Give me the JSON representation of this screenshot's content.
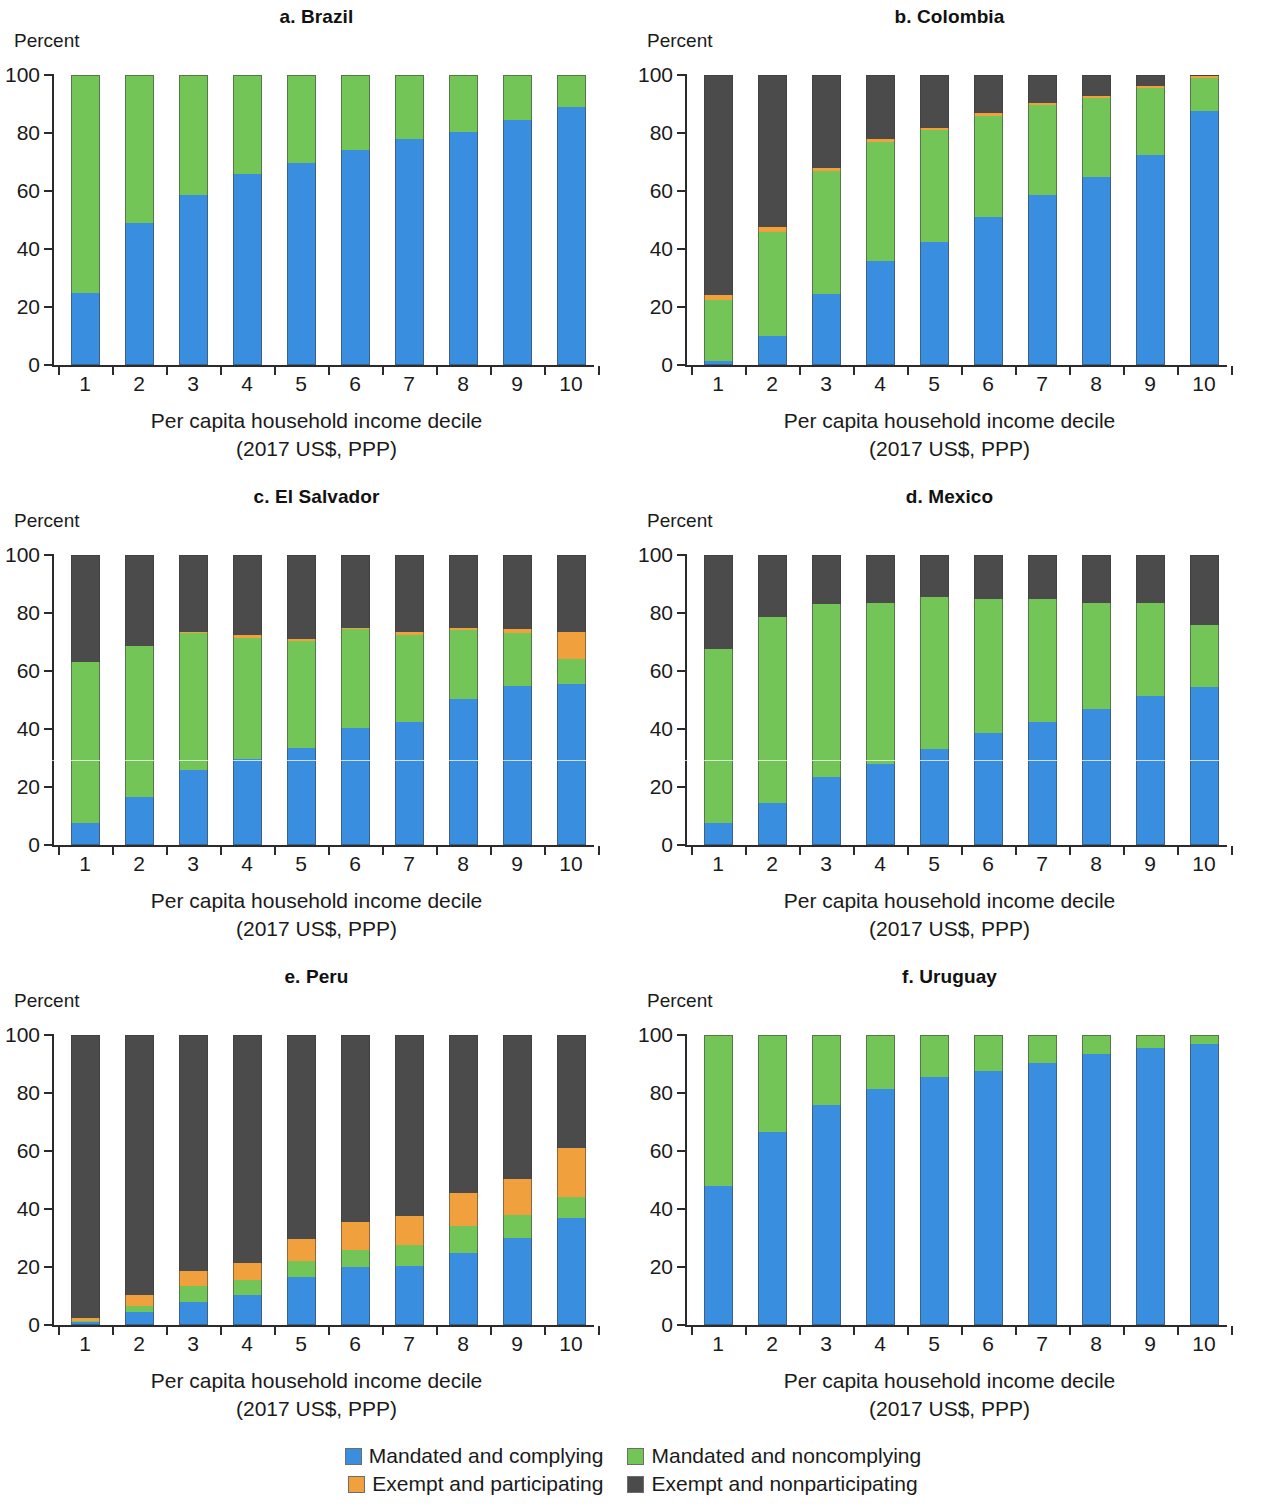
{
  "figure": {
    "y_axis_label": "Percent",
    "x_axis_title_line1": "Per capita household income decile",
    "x_axis_title_line2": "(2017 US$, PPP)",
    "y_ticks": [
      "0",
      "20",
      "40",
      "60",
      "80",
      "100"
    ],
    "x_categories": [
      "1",
      "2",
      "3",
      "4",
      "5",
      "6",
      "7",
      "8",
      "9",
      "10"
    ]
  },
  "legend": {
    "items": [
      {
        "label": "Mandated and complying",
        "color": "#3a8ee0",
        "key": "mandated_complying"
      },
      {
        "label": "Mandated and noncomplying",
        "color": "#73c557",
        "key": "mandated_noncomplying"
      },
      {
        "label": "Exempt and participating",
        "color": "#f1a03e",
        "key": "exempt_participating"
      },
      {
        "label": "Exempt and nonparticipating",
        "color": "#4b4b4b",
        "key": "exempt_nonparticipating"
      }
    ]
  },
  "chart_data": [
    {
      "type": "bar",
      "stacked": true,
      "title": "a. Brazil",
      "panel_letter": "a",
      "country": "Brazil",
      "xlabel": "Per capita household income decile (2017 US$, PPP)",
      "ylabel": "Percent",
      "ylim": [
        0,
        100
      ],
      "grid": false,
      "legend_position": "bottom-figure",
      "categories": [
        "1",
        "2",
        "3",
        "4",
        "5",
        "6",
        "7",
        "8",
        "9",
        "10"
      ],
      "series": [
        {
          "name": "Mandated and complying",
          "color": "#3a8ee0",
          "values": [
            25.0,
            49.0,
            58.5,
            66.0,
            69.5,
            74.0,
            78.0,
            80.5,
            84.5,
            89.0
          ]
        },
        {
          "name": "Mandated and noncomplying",
          "color": "#73c557",
          "values": [
            75.0,
            51.0,
            41.5,
            34.0,
            30.5,
            26.0,
            22.0,
            19.5,
            15.5,
            11.0
          ]
        },
        {
          "name": "Exempt and participating",
          "color": "#f1a03e",
          "values": [
            0,
            0,
            0,
            0,
            0,
            0,
            0,
            0,
            0,
            0
          ]
        },
        {
          "name": "Exempt and nonparticipating",
          "color": "#4b4b4b",
          "values": [
            0,
            0,
            0,
            0,
            0,
            0,
            0,
            0,
            0,
            0
          ]
        }
      ]
    },
    {
      "type": "bar",
      "stacked": true,
      "title": "b. Colombia",
      "panel_letter": "b",
      "country": "Colombia",
      "xlabel": "Per capita household income decile (2017 US$, PPP)",
      "ylabel": "Percent",
      "ylim": [
        0,
        100
      ],
      "grid": false,
      "legend_position": "bottom-figure",
      "categories": [
        "1",
        "2",
        "3",
        "4",
        "5",
        "6",
        "7",
        "8",
        "9",
        "10"
      ],
      "series": [
        {
          "name": "Mandated and complying",
          "color": "#3a8ee0",
          "values": [
            1.5,
            10.0,
            24.5,
            36.0,
            42.5,
            51.0,
            58.5,
            65.0,
            72.5,
            87.5
          ]
        },
        {
          "name": "Mandated and noncomplying",
          "color": "#73c557",
          "values": [
            21.0,
            36.0,
            42.5,
            41.0,
            38.5,
            35.0,
            31.0,
            27.0,
            23.0,
            11.5
          ]
        },
        {
          "name": "Exempt and participating",
          "color": "#f1a03e",
          "values": [
            1.5,
            1.5,
            1.0,
            0.8,
            0.8,
            0.8,
            0.8,
            0.8,
            0.8,
            0.5
          ]
        },
        {
          "name": "Exempt and nonparticipating",
          "color": "#4b4b4b",
          "values": [
            76.0,
            52.5,
            32.0,
            22.2,
            18.2,
            13.2,
            9.7,
            7.2,
            3.7,
            0.5
          ]
        }
      ]
    },
    {
      "type": "bar",
      "stacked": true,
      "title": "c. El Salvador",
      "panel_letter": "c",
      "country": "El Salvador",
      "xlabel": "Per capita household income decile (2017 US$, PPP)",
      "ylabel": "Percent",
      "ylim": [
        0,
        100
      ],
      "grid": false,
      "legend_position": "bottom-figure",
      "categories": [
        "1",
        "2",
        "3",
        "4",
        "5",
        "6",
        "7",
        "8",
        "9",
        "10"
      ],
      "series": [
        {
          "name": "Mandated and complying",
          "color": "#3a8ee0",
          "values": [
            7.5,
            16.5,
            26.0,
            29.5,
            33.5,
            40.5,
            42.5,
            50.5,
            55.0,
            55.5
          ]
        },
        {
          "name": "Mandated and noncomplying",
          "color": "#73c557",
          "values": [
            55.5,
            52.0,
            47.0,
            42.0,
            37.0,
            34.0,
            30.0,
            23.5,
            18.0,
            8.5
          ]
        },
        {
          "name": "Exempt and participating",
          "color": "#f1a03e",
          "values": [
            0.0,
            0.0,
            0.5,
            0.8,
            0.5,
            0.5,
            0.8,
            1.0,
            1.5,
            9.5
          ]
        },
        {
          "name": "Exempt and nonparticipating",
          "color": "#4b4b4b",
          "values": [
            37.0,
            31.5,
            26.5,
            27.7,
            29.0,
            25.0,
            26.7,
            25.0,
            25.5,
            26.5
          ]
        }
      ]
    },
    {
      "type": "bar",
      "stacked": true,
      "title": "d. Mexico",
      "panel_letter": "d",
      "country": "Mexico",
      "xlabel": "Per capita household income decile (2017 US$, PPP)",
      "ylabel": "Percent",
      "ylim": [
        0,
        100
      ],
      "grid": false,
      "legend_position": "bottom-figure",
      "categories": [
        "1",
        "2",
        "3",
        "4",
        "5",
        "6",
        "7",
        "8",
        "9",
        "10"
      ],
      "series": [
        {
          "name": "Mandated and complying",
          "color": "#3a8ee0",
          "values": [
            7.5,
            14.5,
            23.5,
            28.0,
            33.0,
            38.5,
            42.5,
            47.0,
            51.5,
            54.5
          ]
        },
        {
          "name": "Mandated and noncomplying",
          "color": "#73c557",
          "values": [
            60.0,
            64.0,
            59.5,
            55.5,
            52.5,
            46.5,
            42.5,
            36.5,
            32.0,
            21.5
          ]
        },
        {
          "name": "Exempt and participating",
          "color": "#f1a03e",
          "values": [
            0,
            0,
            0,
            0,
            0,
            0,
            0,
            0,
            0,
            0
          ]
        },
        {
          "name": "Exempt and nonparticipating",
          "color": "#4b4b4b",
          "values": [
            32.5,
            21.5,
            17.0,
            16.5,
            14.5,
            15.0,
            15.0,
            16.5,
            16.5,
            24.0
          ]
        }
      ]
    },
    {
      "type": "bar",
      "stacked": true,
      "title": "e. Peru",
      "panel_letter": "e",
      "country": "Peru",
      "xlabel": "Per capita household income decile (2017 US$, PPP)",
      "ylabel": "Percent",
      "ylim": [
        0,
        100
      ],
      "grid": false,
      "legend_position": "bottom-figure",
      "categories": [
        "1",
        "2",
        "3",
        "4",
        "5",
        "6",
        "7",
        "8",
        "9",
        "10"
      ],
      "series": [
        {
          "name": "Mandated and complying",
          "color": "#3a8ee0",
          "values": [
            1.0,
            4.5,
            8.0,
            10.5,
            16.5,
            20.0,
            20.5,
            25.0,
            30.0,
            37.0
          ]
        },
        {
          "name": "Mandated and noncomplying",
          "color": "#73c557",
          "values": [
            0.5,
            2.0,
            5.5,
            5.0,
            5.5,
            6.0,
            7.0,
            9.0,
            8.0,
            7.0
          ]
        },
        {
          "name": "Exempt and participating",
          "color": "#f1a03e",
          "values": [
            1.0,
            4.0,
            5.0,
            6.0,
            7.5,
            9.5,
            10.0,
            11.5,
            12.5,
            17.0
          ]
        },
        {
          "name": "Exempt and nonparticipating",
          "color": "#4b4b4b",
          "values": [
            97.5,
            89.5,
            81.5,
            78.5,
            70.5,
            64.5,
            62.5,
            54.5,
            49.5,
            39.0
          ]
        }
      ]
    },
    {
      "type": "bar",
      "stacked": true,
      "title": "f. Uruguay",
      "panel_letter": "f",
      "country": "Uruguay",
      "xlabel": "Per capita household income decile (2017 US$, PPP)",
      "ylabel": "Percent",
      "ylim": [
        0,
        100
      ],
      "grid": false,
      "legend_position": "bottom-figure",
      "categories": [
        "1",
        "2",
        "3",
        "4",
        "5",
        "6",
        "7",
        "8",
        "9",
        "10"
      ],
      "series": [
        {
          "name": "Mandated and complying",
          "color": "#3a8ee0",
          "values": [
            48.0,
            66.5,
            76.0,
            81.5,
            85.5,
            87.5,
            90.5,
            93.5,
            95.5,
            97.0
          ]
        },
        {
          "name": "Mandated and noncomplying",
          "color": "#73c557",
          "values": [
            52.0,
            33.5,
            24.0,
            18.5,
            14.5,
            12.5,
            9.5,
            6.5,
            4.5,
            3.0
          ]
        },
        {
          "name": "Exempt and participating",
          "color": "#f1a03e",
          "values": [
            0,
            0,
            0,
            0,
            0,
            0,
            0,
            0,
            0,
            0
          ]
        },
        {
          "name": "Exempt and nonparticipating",
          "color": "#4b4b4b",
          "values": [
            0,
            0,
            0,
            0,
            0,
            0,
            0,
            0,
            0,
            0
          ]
        }
      ]
    }
  ]
}
